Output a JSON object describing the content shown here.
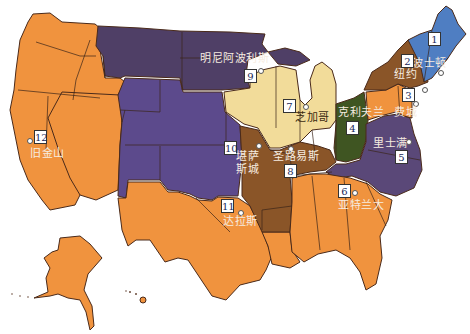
{
  "map": {
    "title": "",
    "districts": [
      {
        "number": "1",
        "city": "波士顿",
        "color": "#4f7ec2"
      },
      {
        "number": "2",
        "city": "纽约",
        "color": "#8a5528"
      },
      {
        "number": "3",
        "city": "费城",
        "color": "#f0933e"
      },
      {
        "number": "4",
        "city": "克利夫兰",
        "color": "#3f5522"
      },
      {
        "number": "5",
        "city": "里士满",
        "color": "#5a4878"
      },
      {
        "number": "6",
        "city": "亚特兰大",
        "color": "#f0933e"
      },
      {
        "number": "7",
        "city": "芝加哥",
        "color": "#f2dc9a"
      },
      {
        "number": "8",
        "city": "圣路易斯",
        "color": "#8a5528"
      },
      {
        "number": "9",
        "city": "明尼阿波利斯",
        "color": "#4f3f66"
      },
      {
        "number": "10",
        "city": "堪萨斯城",
        "color": "#5c4a8c"
      },
      {
        "number": "11",
        "city": "达拉斯",
        "color": "#f0933e"
      },
      {
        "number": "12",
        "city": "旧金山",
        "color": "#f0933e"
      }
    ]
  }
}
